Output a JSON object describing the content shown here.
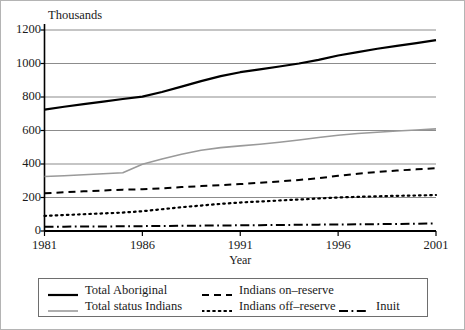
{
  "chart_data": {
    "type": "line",
    "title": "",
    "subtitle": "",
    "unit_label": "Thousands",
    "xlabel": "Year",
    "ylabel": "",
    "xlim": [
      1981,
      2001
    ],
    "ylim": [
      0,
      1200
    ],
    "xticks": [
      "1981",
      "1986",
      "1991",
      "1996",
      "2001"
    ],
    "yticks": [
      "0",
      "200",
      "400",
      "600",
      "800",
      "1000",
      "1200"
    ],
    "grid": "horizontal",
    "legend_position": "bottom",
    "x": [
      1981,
      1982,
      1983,
      1984,
      1985,
      1986,
      1987,
      1988,
      1989,
      1990,
      1991,
      1992,
      1993,
      1994,
      1995,
      1996,
      1997,
      1998,
      1999,
      2000,
      2001
    ],
    "series": [
      {
        "name": "Total Aboriginal",
        "style": "solid",
        "color": "#000000",
        "width": 2.2,
        "values": [
          725,
          742,
          757,
          772,
          788,
          802,
          830,
          862,
          895,
          925,
          948,
          965,
          982,
          1000,
          1022,
          1048,
          1068,
          1088,
          1105,
          1122,
          1140
        ]
      },
      {
        "name": "Total status Indians",
        "style": "solid",
        "color": "#9a9a9a",
        "width": 1.6,
        "values": [
          325,
          330,
          336,
          342,
          348,
          398,
          430,
          458,
          482,
          498,
          508,
          518,
          530,
          543,
          558,
          572,
          582,
          590,
          597,
          603,
          610
        ]
      },
      {
        "name": "Indians on–reserve",
        "style": "dashed",
        "color": "#000000",
        "width": 2.0,
        "values": [
          225,
          231,
          237,
          242,
          247,
          249,
          255,
          262,
          268,
          274,
          280,
          288,
          296,
          305,
          315,
          330,
          342,
          352,
          361,
          368,
          375
        ]
      },
      {
        "name": "Indians off–reserve",
        "style": "dotted",
        "color": "#000000",
        "width": 2.2,
        "values": [
          90,
          95,
          100,
          105,
          110,
          118,
          130,
          142,
          152,
          162,
          170,
          176,
          182,
          188,
          194,
          200,
          204,
          207,
          210,
          212,
          215
        ]
      },
      {
        "name": "Inuit",
        "style": "dashdot",
        "color": "#000000",
        "width": 2.0,
        "values": [
          25,
          26,
          27,
          27,
          28,
          29,
          30,
          31,
          32,
          33,
          34,
          35,
          36,
          37,
          38,
          39,
          40,
          41,
          42,
          43,
          45
        ]
      }
    ]
  },
  "legend": {
    "entries": [
      {
        "label": "Total Aboriginal",
        "swatch": "solid-black-thick"
      },
      {
        "label": "Total status Indians",
        "swatch": "solid-gray-thin"
      },
      {
        "label": "Indians on–reserve",
        "swatch": "dashed-black"
      },
      {
        "label": "Indians off–reserve",
        "swatch": "dotted-black"
      },
      {
        "label": "Inuit",
        "swatch": "dashdot-black"
      }
    ]
  },
  "colors": {
    "axis": "#000000",
    "grid": "#8c8c8c",
    "status_indians": "#9a9a9a",
    "frame": "#b4b4b4",
    "legend_border": "#6e6e6e"
  }
}
